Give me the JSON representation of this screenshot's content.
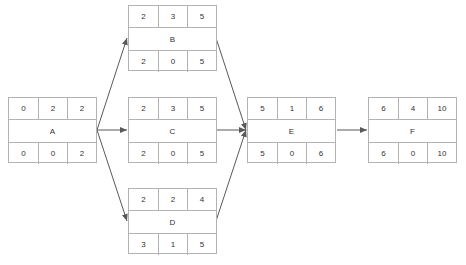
{
  "diagram": {
    "type": "activity-on-node network (critical path)",
    "line_color": "#595959",
    "border_color": "#b3b3b3",
    "nodes": {
      "A": {
        "label": "A",
        "top": [
          "0",
          "2",
          "2"
        ],
        "bottom": [
          "0",
          "0",
          "2"
        ]
      },
      "B": {
        "label": "B",
        "top": [
          "2",
          "3",
          "5"
        ],
        "bottom": [
          "2",
          "0",
          "5"
        ]
      },
      "C": {
        "label": "C",
        "top": [
          "2",
          "3",
          "5"
        ],
        "bottom": [
          "2",
          "0",
          "5"
        ]
      },
      "D": {
        "label": "D",
        "top": [
          "2",
          "2",
          "4"
        ],
        "bottom": [
          "3",
          "1",
          "5"
        ]
      },
      "E": {
        "label": "E",
        "top": [
          "5",
          "1",
          "6"
        ],
        "bottom": [
          "5",
          "0",
          "6"
        ]
      },
      "F": {
        "label": "F",
        "top": [
          "6",
          "4",
          "10"
        ],
        "bottom": [
          "6",
          "0",
          "10"
        ]
      }
    },
    "edges": [
      {
        "from": "A",
        "to": "B"
      },
      {
        "from": "A",
        "to": "C"
      },
      {
        "from": "A",
        "to": "D"
      },
      {
        "from": "B",
        "to": "E"
      },
      {
        "from": "C",
        "to": "E"
      },
      {
        "from": "D",
        "to": "E"
      },
      {
        "from": "E",
        "to": "F"
      }
    ]
  }
}
